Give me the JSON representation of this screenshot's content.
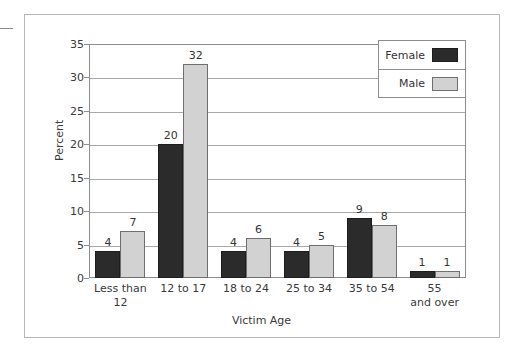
{
  "chart_data": {
    "type": "bar",
    "title": "",
    "xlabel": "Victim Age",
    "ylabel": "Percent",
    "categories": [
      "Less than 12",
      "12 to 17",
      "18 to 24",
      "25 to 34",
      "35 to 54",
      "55 and over"
    ],
    "category_lines": [
      [
        "Less than",
        "12"
      ],
      [
        "12 to 17",
        ""
      ],
      [
        "18 to 24",
        ""
      ],
      [
        "25 to 34",
        ""
      ],
      [
        "35 to 54",
        ""
      ],
      [
        "55",
        "and over"
      ]
    ],
    "series": [
      {
        "name": "Female",
        "color": "#2b2b2b",
        "values": [
          4,
          20,
          4,
          4,
          9,
          1
        ]
      },
      {
        "name": "Male",
        "color": "#d2d2d2",
        "values": [
          7,
          32,
          6,
          5,
          8,
          1
        ]
      }
    ],
    "ylim": [
      0,
      35
    ],
    "yticks": [
      0,
      5,
      10,
      15,
      20,
      25,
      30,
      35
    ],
    "ytick_labels": [
      "0",
      "5",
      "10",
      "15",
      "20",
      "25",
      "30",
      "35"
    ],
    "grid": true,
    "legend_position": "top-right",
    "data_labels": true
  },
  "legend": {
    "items": [
      {
        "label": "Female",
        "swatch": "female-swatch"
      },
      {
        "label": "Male",
        "swatch": "male-swatch"
      }
    ]
  }
}
